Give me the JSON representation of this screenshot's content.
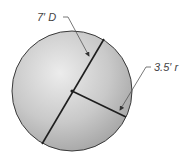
{
  "figure": {
    "type": "circle-dimension-diagram",
    "colors": {
      "fill_light": "#e6e6e6",
      "fill_dark": "#a9a9a9",
      "outline": "#3a3a3a",
      "line": "#1e1e1e",
      "leader": "#555555",
      "label": "#444444"
    },
    "circle": {
      "cx": 72,
      "cy": 91,
      "r": 60
    },
    "diameter_line": {
      "x1": 104,
      "y1": 39,
      "x2": 42,
      "y2": 144
    },
    "radius_line": {
      "x1": 72,
      "y1": 91,
      "x2": 126,
      "y2": 117
    }
  },
  "labels": {
    "diameter": "7′ D",
    "radius": "3.5′ r"
  }
}
